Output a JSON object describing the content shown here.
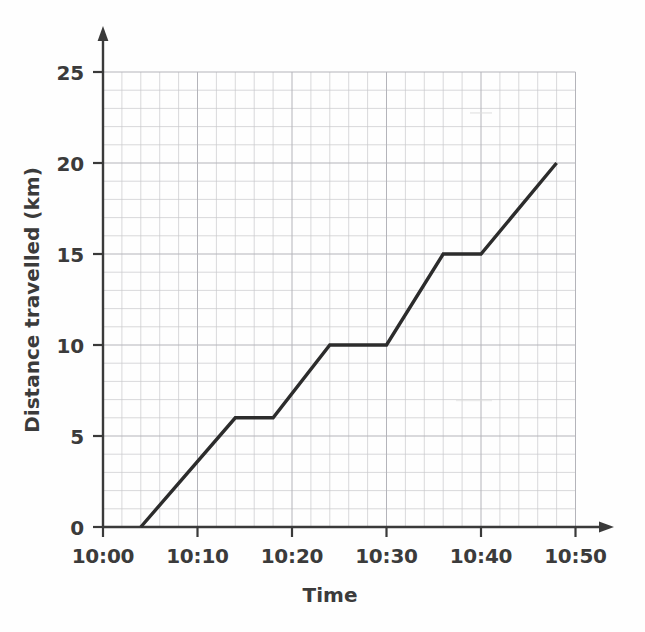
{
  "chart_data": {
    "type": "line",
    "title": "",
    "subtitle": "",
    "xlabel": "Time",
    "ylabel": "Distance travelled (km)",
    "x_tick_labels": [
      "10:00",
      "10:10",
      "10:20",
      "10:30",
      "10:40",
      "10:50"
    ],
    "x_tick_values": [
      0,
      10,
      20,
      30,
      40,
      50
    ],
    "y_tick_labels": [
      "0",
      "5",
      "10",
      "15",
      "20",
      "25"
    ],
    "y_tick_values": [
      0,
      5,
      10,
      15,
      20,
      25
    ],
    "xlim": [
      0,
      50
    ],
    "ylim": [
      0,
      25
    ],
    "x_unit": "minutes after 10:00",
    "y_unit": "km",
    "grid": true,
    "grid_minor_step_x": 2,
    "grid_minor_step_y": 1,
    "grid_major_step_x": 10,
    "grid_major_step_y": 5,
    "legend": "none",
    "series": [
      {
        "name": "Distance travelled",
        "color": "#2c2c2c",
        "x": [
          4,
          14,
          18,
          24,
          30,
          36,
          40,
          48
        ],
        "y": [
          0,
          6,
          6,
          10,
          10,
          15,
          15,
          20
        ],
        "x_labels": [
          "10:04",
          "10:14",
          "10:18",
          "10:24",
          "10:30",
          "10:36",
          "10:40",
          "10:48"
        ]
      }
    ],
    "axis_arrows": {
      "x": true,
      "y": true
    }
  },
  "axes": {
    "y_title": "Distance travelled (km)",
    "x_title": "Time",
    "x_labels": [
      "10:00",
      "10:10",
      "10:20",
      "10:30",
      "10:40",
      "10:50"
    ],
    "y_labels": [
      "0",
      "5",
      "10",
      "15",
      "20",
      "25"
    ]
  },
  "colors": {
    "line": "#2c2c2c",
    "axis": "#3a3a3a",
    "grid_minor": "#c9c9cc",
    "grid_major": "#b4b4ba",
    "background": "#fefefe",
    "text": "#3b3b3b"
  }
}
